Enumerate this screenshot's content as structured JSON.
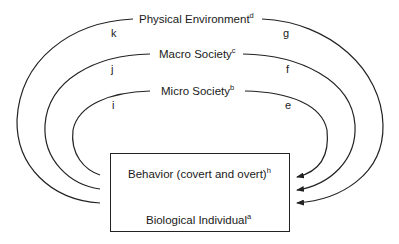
{
  "diagram": {
    "type": "nested-feedback-loops",
    "rings": [
      {
        "name": "Physical Environment",
        "superscript": "d",
        "left_letter": "k",
        "right_letter": "g"
      },
      {
        "name": "Macro Society",
        "superscript": "c",
        "left_letter": "j",
        "right_letter": "f"
      },
      {
        "name": "Micro Society",
        "superscript": "b",
        "left_letter": "i",
        "right_letter": "e"
      }
    ],
    "box": {
      "top_label": "Behavior (covert and overt)",
      "top_superscript": "h",
      "bottom_label": "Biological Individual",
      "bottom_superscript": "a",
      "internal_arrows": [
        "up",
        "down"
      ]
    },
    "colors": {
      "line": "#222222",
      "background": "#ffffff"
    }
  }
}
